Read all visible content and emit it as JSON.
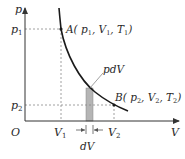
{
  "diagram": {
    "type": "p-V diagram (isothermal-like expansion curve with work element)",
    "axes": {
      "y_label": "p",
      "x_label": "V",
      "origin_label": "O"
    },
    "ticks": {
      "p1": "p",
      "p1_sub": "1",
      "p2": "p",
      "p2_sub": "2",
      "V1": "V",
      "V1_sub": "1",
      "V2": "V",
      "V2_sub": "2"
    },
    "points": {
      "A": {
        "text": "A( p",
        "s1": "1",
        "m1": ", V",
        "s2": "1",
        "m2": ", T",
        "s3": "1",
        "end": ")"
      },
      "B": {
        "text": "B( p",
        "s1": "2",
        "m1": ", V",
        "s2": "2",
        "m2": ", T",
        "s3": "2",
        "end": ")"
      }
    },
    "annotations": {
      "work_element": "pdV",
      "width_element": "dV"
    },
    "colors": {
      "curve": "#1a1a1a",
      "axis": "#333333",
      "dashed": "#777777",
      "strip_fill": "#b5b5b5",
      "text": "#2a2a2a"
    }
  }
}
